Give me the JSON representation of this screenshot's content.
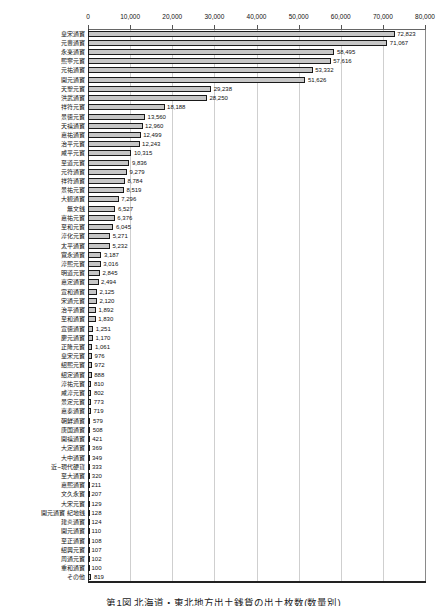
{
  "chart_data": {
    "type": "bar",
    "orientation": "horizontal",
    "title_caption": "第1図 北海道・東北地方出土銭貨の出土枚数(数量別)",
    "categories": [
      "皇宋通寶",
      "元豊通寶",
      "永楽通寶",
      "熙寧元寶",
      "元祐通寶",
      "開元通寶",
      "天聖元寶",
      "洪武通寶",
      "祥符元寶",
      "景徳元寶",
      "天禧通寶",
      "嘉祐通寶",
      "治平元寶",
      "咸平元寶",
      "至道元寶",
      "元符通寶",
      "祥符通寶",
      "景祐元寶",
      "大観通寶",
      "無文銭",
      "嘉祐元寶",
      "至和元寶",
      "淳化元寶",
      "太平通寶",
      "寛永通寶",
      "淳熙元寶",
      "明道元寶",
      "嘉定通寶",
      "宣和通寶",
      "宋通元寶",
      "治平通寶",
      "至和通寶",
      "宣徳通寶",
      "慶元通寶",
      "正隆元寶",
      "皇宋元寶",
      "紹熙元寶",
      "紹定通寶",
      "淳祐元寶",
      "咸淳元寶",
      "景定元寶",
      "嘉泰通寶",
      "朝鮮通寶",
      "唐国通寶",
      "開禧通寶",
      "大定通寶",
      "大中通寶",
      "近~現代硬貨",
      "至大通寶",
      "嘉熙通寶",
      "文久永寶",
      "大宋元寶",
      "開元通寶 紀地銭",
      "建炎通寶",
      "開元通寶",
      "至正通寶",
      "紹興元寶",
      "周通元寶",
      "重和通寶",
      "その他"
    ],
    "values": [
      72823,
      71067,
      58495,
      57616,
      53332,
      51626,
      29238,
      28250,
      18188,
      13560,
      12960,
      12499,
      12243,
      10315,
      9836,
      9279,
      8784,
      8519,
      7296,
      6527,
      6376,
      6045,
      5271,
      5232,
      3187,
      3016,
      2845,
      2494,
      2125,
      2120,
      1892,
      1830,
      1251,
      1170,
      1061,
      976,
      972,
      888,
      810,
      802,
      773,
      719,
      579,
      508,
      421,
      369,
      349,
      333,
      320,
      211,
      207,
      129,
      128,
      124,
      110,
      108,
      107,
      102,
      100,
      819
    ],
    "xlabel": "",
    "ylabel": "",
    "xlim": [
      0,
      80000
    ],
    "axis_ticks": [
      "0",
      "10,000",
      "20,000",
      "30,000",
      "40,000",
      "50,000",
      "60,000",
      "70,000",
      "80,000"
    ],
    "grid": true,
    "legend": "none",
    "colors": {
      "bar_fill": "#c6c6c6",
      "bar_border": "#1a1a1a",
      "gridline": "#cfcfcf",
      "axis": "#333333",
      "background": "#ffffff"
    }
  }
}
